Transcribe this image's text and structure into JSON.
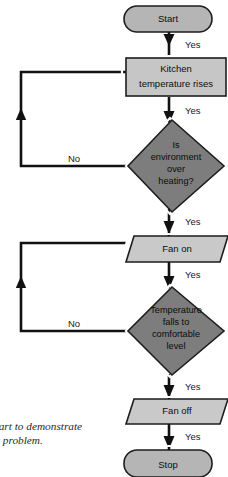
{
  "diagram": {
    "type": "flowchart",
    "colors": {
      "terminator_fill": "#b5b5b5",
      "process_fill": "#c6c6c6",
      "io_fill": "#c9c9c9",
      "decision_fill": "#7d7d7d",
      "line": "#111111",
      "text": "#0d0d0d",
      "background": "#ffffff"
    },
    "nodes": [
      {
        "id": "start",
        "shape": "terminator",
        "label": "Start"
      },
      {
        "id": "kitchen",
        "shape": "process",
        "label": "Kitchen temperature rises",
        "lines": [
          "Kitchen",
          "temperature rises"
        ]
      },
      {
        "id": "dec1",
        "shape": "decision",
        "label": "Is environment over heating?",
        "lines": [
          "Is",
          "environment",
          "over",
          "heating?"
        ]
      },
      {
        "id": "fanon",
        "shape": "input-output",
        "label": "Fan on"
      },
      {
        "id": "dec2",
        "shape": "decision",
        "label": "Temperature falls to comfortable level",
        "lines": [
          "Temperature",
          "falls to",
          "comfortable",
          "level"
        ]
      },
      {
        "id": "fanoff",
        "shape": "input-output",
        "label": "Fan off"
      },
      {
        "id": "stop",
        "shape": "terminator",
        "label": "Stop"
      }
    ],
    "edge_labels": {
      "yes_1": "Yes",
      "yes_2": "Yes",
      "yes_3": "Yes",
      "yes_4": "Yes",
      "no_1": "No",
      "no_2": "No"
    }
  },
  "caption": {
    "line1": "chart to demonstrate",
    "line2": "uit problem."
  }
}
